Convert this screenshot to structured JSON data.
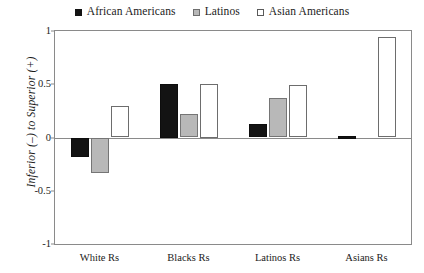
{
  "chart_data": {
    "type": "bar",
    "title": "",
    "xlabel": "",
    "ylabel": "Inferior (–) to Superior (+)",
    "ylim": [
      -1,
      1
    ],
    "yticks": [
      "1",
      "0.5",
      "0",
      "-0.5",
      "-1"
    ],
    "ytick_values": [
      1,
      0.5,
      0,
      -0.5,
      -1
    ],
    "grid": false,
    "legend_position": "top-center",
    "categories": [
      "White Rs",
      "Blacks Rs",
      "Latinos Rs",
      "Asians Rs"
    ],
    "series": [
      {
        "name": "African Americans",
        "swatch": "filled-black-square",
        "color": "#131313",
        "values": [
          -0.18,
          0.5,
          0.13,
          0.015
        ]
      },
      {
        "name": "Latinos",
        "swatch": "filled-gray-square",
        "color": "#b8b8b8",
        "values": [
          -0.33,
          0.22,
          0.37,
          0.0
        ]
      },
      {
        "name": "Asian Americans",
        "swatch": "open-white-square",
        "color": "#ffffff",
        "values": [
          0.3,
          0.5,
          0.49,
          0.94
        ]
      }
    ]
  },
  "legend": {
    "items": [
      {
        "label": "African Americans",
        "swatch_class": "swatch-black"
      },
      {
        "label": "Latinos",
        "swatch_class": "swatch-gray"
      },
      {
        "label": "Asian Americans",
        "swatch_class": "swatch-white"
      }
    ]
  },
  "axis": {
    "y_title": "Inferior (–) to Superior (+)"
  }
}
